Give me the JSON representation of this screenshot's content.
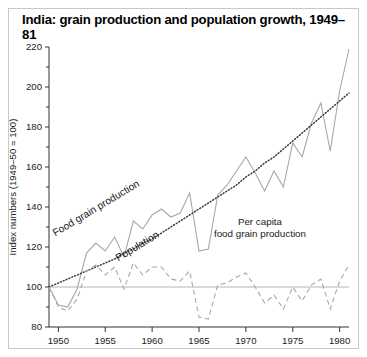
{
  "figure": {
    "title": "India: grain production and population growth, 1949–81",
    "border_color": "#c8c8c8",
    "background": "#ffffff"
  },
  "chart_data": {
    "type": "line",
    "title": "India: grain production and population growth, 1949–81",
    "xlabel": "",
    "ylabel": "Index numbers (1949–50 = 100)",
    "xlim": [
      1949,
      1981
    ],
    "ylim": [
      80,
      220
    ],
    "y_major_ticks": [
      80,
      100,
      120,
      140,
      160,
      180,
      200,
      220
    ],
    "y_minor_ticks": [
      90,
      110,
      130,
      150,
      170,
      190,
      210
    ],
    "x_ticks": [
      1950,
      1955,
      1960,
      1965,
      1970,
      1975,
      1980
    ],
    "x_tick_labels": [
      "1950",
      "1955",
      "1960",
      "1965",
      "1970",
      "1975",
      "1980"
    ],
    "grid": false,
    "reference_line": {
      "value": 100,
      "color": "#b4b4b4"
    },
    "legend_position": "inline-annotations",
    "x": [
      1949,
      1950,
      1951,
      1952,
      1953,
      1954,
      1955,
      1956,
      1957,
      1958,
      1959,
      1960,
      1961,
      1962,
      1963,
      1964,
      1965,
      1966,
      1967,
      1968,
      1969,
      1970,
      1971,
      1972,
      1973,
      1974,
      1975,
      1976,
      1977,
      1978,
      1979,
      1980,
      1981
    ],
    "series": [
      {
        "name": "Food grain production",
        "style": "solid",
        "color": "#a8a8a8",
        "label_rotation": -31,
        "values": [
          100,
          91,
          90,
          99,
          117,
          122,
          118,
          125,
          115,
          133,
          129,
          136,
          139,
          135,
          137,
          147,
          118,
          119,
          146,
          151,
          158,
          165,
          157,
          148,
          158,
          150,
          172,
          165,
          182,
          192,
          168,
          198,
          219
        ]
      },
      {
        "name": "Population",
        "style": "dotted",
        "color": "#3c3c3c",
        "label_rotation": -31,
        "values": [
          100,
          102,
          104,
          106,
          108,
          110,
          112,
          114,
          117,
          119,
          122,
          124,
          127,
          130,
          133,
          136,
          139,
          142,
          145,
          148,
          151,
          155,
          158,
          162,
          165,
          169,
          173,
          177,
          181,
          185,
          189,
          193,
          197
        ]
      },
      {
        "name": "Per capita food grain production",
        "style": "dashed",
        "color": "#a8a8a8",
        "values": [
          100,
          90,
          88,
          94,
          108,
          111,
          106,
          110,
          99,
          112,
          106,
          110,
          110,
          104,
          103,
          108,
          85,
          84,
          101,
          102,
          105,
          107,
          100,
          92,
          96,
          89,
          100,
          93,
          101,
          104,
          89,
          103,
          111
        ]
      }
    ],
    "annotations": [
      {
        "text": "Food grain production",
        "x": 1954.2,
        "y": 138,
        "rotation": -31
      },
      {
        "text": "Population",
        "x": 1958.6,
        "y": 119,
        "rotation": -31
      },
      {
        "text": "Per capita",
        "x": 1971.5,
        "y": 131,
        "rotation": 0
      },
      {
        "text": "food grain production",
        "x": 1971.5,
        "y": 125,
        "rotation": 0
      }
    ]
  }
}
